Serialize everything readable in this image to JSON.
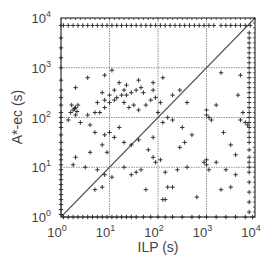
{
  "chart_data": {
    "type": "scatter",
    "title": "",
    "xlabel": "ILP (s)",
    "ylabel": "A*-ec (s)",
    "xscale": "log",
    "yscale": "log",
    "xlim": [
      1,
      10000
    ],
    "ylim": [
      1,
      10000
    ],
    "grid": true,
    "legend": null,
    "x_ticks": [
      {
        "base": "10",
        "exp": "0"
      },
      {
        "base": "10",
        "exp": "1"
      },
      {
        "base": "10",
        "exp": "2"
      },
      {
        "base": "10",
        "exp": "3"
      },
      {
        "base": "10",
        "exp": "4"
      }
    ],
    "y_ticks": [
      {
        "base": "10",
        "exp": "0"
      },
      {
        "base": "10",
        "exp": "1"
      },
      {
        "base": "10",
        "exp": "2"
      },
      {
        "base": "10",
        "exp": "3"
      },
      {
        "base": "10",
        "exp": "4"
      }
    ],
    "reference_line": {
      "label": "y = x",
      "from": [
        1,
        1
      ],
      "to": [
        10000,
        10000
      ]
    },
    "marker": "+",
    "colors": {
      "points": "#333333",
      "grid": "#777777",
      "frame": "#333333",
      "diagonal": "#555555"
    },
    "series": [
      {
        "name": "instances",
        "points_log10": [
          [
            0.55,
            2.8
          ],
          [
            0.9,
            2.85
          ],
          [
            0.3,
            2.6
          ],
          [
            1.3,
            2.55
          ],
          [
            1.9,
            2.55
          ],
          [
            1.05,
            2.95
          ],
          [
            0.2,
            2.1
          ],
          [
            0.3,
            2.2
          ],
          [
            0.25,
            2.15
          ],
          [
            0.35,
            2.25
          ],
          [
            0.3,
            2.05
          ],
          [
            0.22,
            2.25
          ],
          [
            0.33,
            2.12
          ],
          [
            0.28,
            2.18
          ],
          [
            0.55,
            2.05
          ],
          [
            0.7,
            2.1
          ],
          [
            0.8,
            2.1
          ],
          [
            0.9,
            2.2
          ],
          [
            1.0,
            2.3
          ],
          [
            1.1,
            2.35
          ],
          [
            1.15,
            2.4
          ],
          [
            1.25,
            2.45
          ],
          [
            1.35,
            2.45
          ],
          [
            1.45,
            2.5
          ],
          [
            1.55,
            2.55
          ],
          [
            1.65,
            2.6
          ],
          [
            1.7,
            2.5
          ],
          [
            0.9,
            2.35
          ],
          [
            1.0,
            2.45
          ],
          [
            1.1,
            2.55
          ],
          [
            1.3,
            2.3
          ],
          [
            1.4,
            2.2
          ],
          [
            1.5,
            2.25
          ],
          [
            1.6,
            2.15
          ],
          [
            1.75,
            2.25
          ],
          [
            1.85,
            2.35
          ],
          [
            1.95,
            2.4
          ],
          [
            2.05,
            2.3
          ],
          [
            0.75,
            2.3
          ],
          [
            0.85,
            2.5
          ],
          [
            1.2,
            2.7
          ],
          [
            1.35,
            2.65
          ],
          [
            1.6,
            2.75
          ],
          [
            1.9,
            2.7
          ],
          [
            0.15,
            1.95
          ],
          [
            0.4,
            1.9
          ],
          [
            0.6,
            1.85
          ],
          [
            0.7,
            1.7
          ],
          [
            0.9,
            1.65
          ],
          [
            1.0,
            1.7
          ],
          [
            1.1,
            1.6
          ],
          [
            1.2,
            1.8
          ],
          [
            1.3,
            1.5
          ],
          [
            1.45,
            1.45
          ],
          [
            1.6,
            1.55
          ],
          [
            1.8,
            1.35
          ],
          [
            1.9,
            1.6
          ],
          [
            0.85,
            1.45
          ],
          [
            0.95,
            1.3
          ],
          [
            0.6,
            1.3
          ],
          [
            0.3,
            1.2
          ],
          [
            0.25,
            1.05
          ],
          [
            0.5,
            1.0
          ],
          [
            0.75,
            0.95
          ],
          [
            0.9,
            0.85
          ],
          [
            1.05,
            0.8
          ],
          [
            0.85,
            0.6
          ],
          [
            0.7,
            0.55
          ],
          [
            1.3,
            1.0
          ],
          [
            1.45,
            0.85
          ],
          [
            1.55,
            0.9
          ],
          [
            1.65,
            0.95
          ],
          [
            1.75,
            0.55
          ],
          [
            2.1,
            2.8
          ],
          [
            2.0,
            2.1
          ],
          [
            2.2,
            2.0
          ],
          [
            2.3,
            2.45
          ],
          [
            2.45,
            2.55
          ],
          [
            2.6,
            2.3
          ],
          [
            2.1,
            1.9
          ],
          [
            2.3,
            1.95
          ],
          [
            2.5,
            1.8
          ],
          [
            2.7,
            1.65
          ],
          [
            2.55,
            1.5
          ],
          [
            2.45,
            1.4
          ],
          [
            2.6,
            1.0
          ],
          [
            2.4,
            0.95
          ],
          [
            2.15,
            0.9
          ],
          [
            1.9,
            1.2
          ],
          [
            1.95,
            1.1
          ],
          [
            2.05,
            1.15
          ],
          [
            2.2,
            0.6
          ],
          [
            2.3,
            0.6
          ],
          [
            2.1,
            0.35
          ],
          [
            2.15,
            0.35
          ],
          [
            2.8,
            0.4
          ],
          [
            3.0,
            2.15
          ],
          [
            3.0,
            2.05
          ],
          [
            3.05,
            2.0
          ],
          [
            3.1,
            1.95
          ],
          [
            3.2,
            2.25
          ],
          [
            3.35,
            1.7
          ],
          [
            3.5,
            1.45
          ],
          [
            3.6,
            1.25
          ],
          [
            3.7,
            1.95
          ],
          [
            3.75,
            2.1
          ],
          [
            3.8,
            1.9
          ],
          [
            3.85,
            1.85
          ],
          [
            3.65,
            2.45
          ],
          [
            3.3,
            2.9
          ],
          [
            3.7,
            2.85
          ],
          [
            3.0,
            1.05
          ],
          [
            3.05,
            0.95
          ],
          [
            3.2,
            1.1
          ],
          [
            3.4,
            0.95
          ],
          [
            3.5,
            0.6
          ],
          [
            3.6,
            0.85
          ],
          [
            3.3,
            0.55
          ],
          [
            3.0,
            1.15
          ],
          [
            2.95,
            1.1
          ]
        ],
        "top_band_points_x_log10": [
          0.05,
          0.15,
          0.25,
          0.35,
          0.45,
          0.55,
          0.65,
          0.75,
          0.85,
          0.95,
          1.05,
          1.15,
          1.25,
          1.35,
          1.45,
          1.55,
          1.65,
          1.75,
          1.85,
          1.95,
          2.05,
          2.15,
          2.25,
          2.35,
          2.45,
          2.55,
          2.65,
          2.75,
          2.85,
          2.95,
          3.05,
          3.15,
          3.3,
          3.4,
          3.5,
          3.6,
          3.7,
          3.8,
          3.9
        ],
        "top_band_y_log10": 3.85,
        "right_band_points_y_log10": [
          0.1,
          0.3,
          0.5,
          0.7,
          0.9,
          1.0,
          1.1,
          1.2,
          1.35,
          1.5,
          1.6,
          1.7,
          1.8,
          1.9,
          2.0,
          2.1,
          2.2,
          2.3,
          2.4,
          2.5,
          2.6,
          2.7,
          2.8,
          2.9,
          3.0,
          3.1,
          3.2,
          3.3,
          3.4,
          3.5,
          3.6,
          3.7
        ],
        "right_band_x_log10": 3.88,
        "left_axis_points_y_log10": [
          0.05,
          0.15,
          0.25,
          0.35,
          0.45,
          0.55,
          0.65,
          0.75,
          0.85,
          0.95,
          1.05,
          1.15,
          1.25,
          1.35,
          1.5,
          1.65,
          1.8,
          1.9,
          2.0,
          2.1,
          2.25,
          2.4,
          2.55,
          2.75,
          3.0,
          3.2,
          3.4,
          3.6,
          3.85
        ],
        "bottom_axis_points_x_log10": [
          0.05,
          0.15,
          0.25,
          0.35,
          0.45,
          0.55,
          0.65,
          0.75,
          0.85,
          0.95,
          1.05,
          1.15,
          1.25,
          1.35,
          1.45,
          1.55,
          1.7,
          1.85,
          2.0,
          2.15,
          2.3,
          2.5,
          2.7,
          2.85,
          3.0,
          3.2,
          3.4,
          3.6,
          3.8,
          3.95
        ]
      }
    ]
  }
}
